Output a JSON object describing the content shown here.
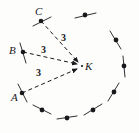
{
  "figure": {
    "background_color": "#fdfdfc",
    "ink_color": "#19191c",
    "center": {
      "name": "K",
      "label": "K",
      "x": 82,
      "y": 66,
      "label_x": 85,
      "label_y": 61
    },
    "radius_labels": [
      {
        "id": "label-ck",
        "text": "3",
        "x": 61,
        "y": 33
      },
      {
        "id": "label-bk",
        "text": "3",
        "x": 41,
        "y": 45
      },
      {
        "id": "label-ak",
        "text": "3",
        "x": 36,
        "y": 68
      }
    ],
    "labeled_points": [
      {
        "name": "C",
        "label": "C",
        "x": 41,
        "y": 21,
        "label_x": 35,
        "label_y": 6,
        "tick_x1": 33,
        "tick_y1": 26,
        "tick_x2": 51,
        "tick_y2": 17,
        "arrow_to_x": 78,
        "arrow_to_y": 62
      },
      {
        "name": "B",
        "label": "B",
        "x": 23,
        "y": 52,
        "label_x": 9,
        "label_y": 45,
        "tick_x1": 20,
        "tick_y1": 43,
        "tick_x2": 26,
        "tick_y2": 63,
        "arrow_to_x": 77,
        "arrow_to_y": 64
      },
      {
        "name": "A",
        "label": "A",
        "x": 22,
        "y": 93,
        "label_x": 11,
        "label_y": 92,
        "tick_x1": 18,
        "tick_y1": 84,
        "tick_x2": 27,
        "tick_y2": 102,
        "arrow_to_x": 77,
        "arrow_to_y": 69
      }
    ],
    "circle_points": [
      {
        "id": "dot-top",
        "x": 85,
        "y": 15,
        "tick_x1": 75,
        "tick_y1": 18,
        "tick_x2": 96,
        "tick_y2": 13
      },
      {
        "id": "dot-upper-right",
        "x": 116,
        "y": 40,
        "tick_x1": 110,
        "tick_y1": 31,
        "tick_x2": 121,
        "tick_y2": 49
      },
      {
        "id": "dot-right",
        "x": 124,
        "y": 66,
        "tick_x1": 123,
        "tick_y1": 56,
        "tick_x2": 125,
        "tick_y2": 77
      },
      {
        "id": "dot-lower-right",
        "x": 114,
        "y": 92,
        "tick_x1": 119,
        "tick_y1": 83,
        "tick_x2": 108,
        "tick_y2": 101
      },
      {
        "id": "dot-bottom-right",
        "x": 93,
        "y": 110,
        "tick_x1": 102,
        "tick_y1": 104,
        "tick_x2": 84,
        "tick_y2": 115
      },
      {
        "id": "dot-bottom",
        "x": 67,
        "y": 118,
        "tick_x1": 77,
        "tick_y1": 116,
        "tick_x2": 57,
        "tick_y2": 119
      },
      {
        "id": "dot-bottom-left",
        "x": 42,
        "y": 110,
        "tick_x1": 51,
        "tick_y1": 114,
        "tick_x2": 33,
        "tick_y2": 105
      }
    ],
    "line_style": {
      "dash_pattern": "4,3",
      "stroke_width": 1
    }
  }
}
